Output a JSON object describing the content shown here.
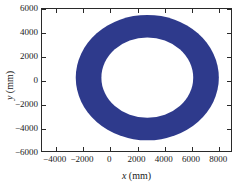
{
  "figure": {
    "background_color": "#ffffff",
    "axis_color": "#2a2a2a"
  },
  "chart_data": {
    "type": "scatter",
    "title": "",
    "subtitle": "",
    "xlabel": "x (mm)",
    "ylabel": "y (mm)",
    "xlabel_var": "x",
    "xlabel_unit": "(mm)",
    "ylabel_var": "y",
    "ylabel_unit": "(mm)",
    "xlim": [
      -5000,
      9000
    ],
    "ylim": [
      -6000,
      6000
    ],
    "xticks": [
      -4000,
      -2000,
      0,
      2000,
      4000,
      6000,
      8000
    ],
    "yticks": [
      6000,
      4000,
      2000,
      0,
      -2000,
      -4000,
      -6000
    ],
    "xticklabels": [
      "−4000",
      "−2000",
      "0",
      "2000",
      "4000",
      "6000",
      "8000"
    ],
    "yticklabels": [
      "6000",
      "4000",
      "2000",
      "0",
      "−2000",
      "−4000",
      "−6000"
    ],
    "grid": false,
    "legend": null,
    "series": [
      {
        "name": "annulus-point-cloud",
        "shape": "annulus",
        "color": "#2e3a8c",
        "center_x": 2800,
        "center_y": 200,
        "outer_radius": 5300,
        "inner_radius": 3400,
        "fill": true
      }
    ],
    "annotations": []
  }
}
